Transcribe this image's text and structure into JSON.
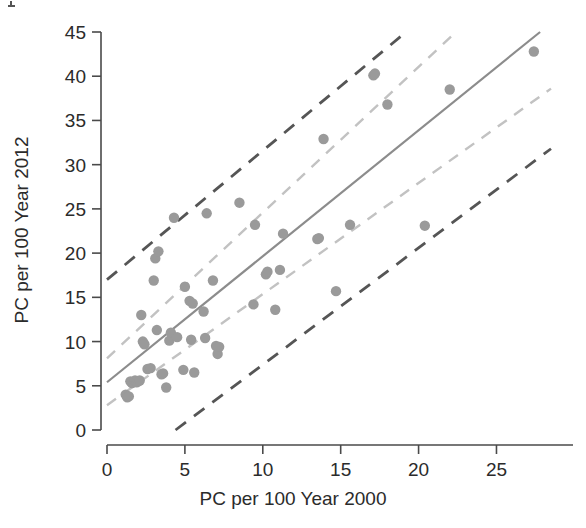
{
  "chart_data": {
    "type": "scatter",
    "title": "",
    "xlabel": "PC per 100 Year 2000",
    "ylabel": "PC per 100 Year 2012",
    "xlim": [
      0,
      28.5
    ],
    "ylim": [
      0,
      45
    ],
    "xticks": [
      0,
      5,
      10,
      15,
      20,
      25
    ],
    "xtick_labels": [
      "0",
      "5",
      "10",
      "15",
      "20",
      "25"
    ],
    "yticks": [
      0,
      5,
      10,
      15,
      20,
      25,
      30,
      35,
      40,
      45
    ],
    "ytick_labels": [
      "0",
      "5",
      "10",
      "15",
      "20",
      "25",
      "30",
      "35",
      "40",
      "45"
    ],
    "grid": false,
    "legend": "none",
    "points": [
      [
        1.2,
        4.0
      ],
      [
        1.3,
        3.7
      ],
      [
        1.4,
        3.8
      ],
      [
        1.5,
        5.5
      ],
      [
        1.6,
        5.3
      ],
      [
        1.8,
        5.6
      ],
      [
        1.9,
        5.4
      ],
      [
        2.0,
        5.5
      ],
      [
        2.1,
        5.6
      ],
      [
        2.2,
        13.0
      ],
      [
        2.3,
        10.0
      ],
      [
        2.4,
        9.7
      ],
      [
        2.6,
        6.9
      ],
      [
        2.8,
        7.0
      ],
      [
        3.0,
        16.9
      ],
      [
        3.1,
        19.4
      ],
      [
        3.2,
        11.3
      ],
      [
        3.3,
        20.2
      ],
      [
        3.5,
        6.3
      ],
      [
        3.6,
        6.4
      ],
      [
        3.8,
        4.8
      ],
      [
        4.0,
        10.1
      ],
      [
        4.1,
        11.0
      ],
      [
        4.3,
        24.0
      ],
      [
        4.5,
        10.5
      ],
      [
        4.9,
        6.8
      ],
      [
        5.0,
        16.2
      ],
      [
        5.3,
        14.6
      ],
      [
        5.4,
        10.2
      ],
      [
        5.5,
        14.3
      ],
      [
        5.6,
        6.5
      ],
      [
        6.2,
        13.4
      ],
      [
        6.3,
        10.4
      ],
      [
        6.4,
        24.5
      ],
      [
        6.8,
        16.9
      ],
      [
        7.0,
        9.5
      ],
      [
        7.1,
        8.6
      ],
      [
        7.2,
        9.4
      ],
      [
        8.5,
        25.7
      ],
      [
        9.4,
        14.2
      ],
      [
        9.5,
        23.2
      ],
      [
        10.2,
        17.6
      ],
      [
        10.3,
        17.9
      ],
      [
        10.8,
        13.6
      ],
      [
        11.1,
        18.1
      ],
      [
        11.3,
        22.2
      ],
      [
        13.5,
        21.6
      ],
      [
        13.6,
        21.7
      ],
      [
        13.9,
        32.9
      ],
      [
        14.7,
        15.7
      ],
      [
        15.6,
        23.2
      ],
      [
        17.1,
        40.1
      ],
      [
        17.2,
        40.3
      ],
      [
        18.0,
        36.8
      ],
      [
        20.4,
        23.1
      ],
      [
        22.0,
        38.5
      ],
      [
        27.4,
        42.8
      ]
    ],
    "fit_line": {
      "name": "regression-line",
      "style": "solid",
      "color": "#8c8c8c",
      "x_start": 0.0,
      "y_start": 5.4,
      "x_end": 27.8,
      "y_end": 45.0
    },
    "inner_band": {
      "name": "confidence-band",
      "style": "dashed",
      "color": "#c2c2c2",
      "upper": {
        "x_start": 0.0,
        "y_start": 8.1,
        "x_end": 22.4,
        "y_end": 45.0
      },
      "lower": {
        "x_start": 0.0,
        "y_start": 2.8,
        "x_end": 28.5,
        "y_end": 38.6
      }
    },
    "outer_band": {
      "name": "prediction-band",
      "style": "dashed",
      "color": "#555555",
      "upper": {
        "x_start": 0.0,
        "y_start": 17.0,
        "x_end": 19.2,
        "y_end": 45.0
      },
      "lower": {
        "x_start": 4.4,
        "y_start": 0.0,
        "x_end": 28.5,
        "y_end": 31.8
      }
    }
  }
}
